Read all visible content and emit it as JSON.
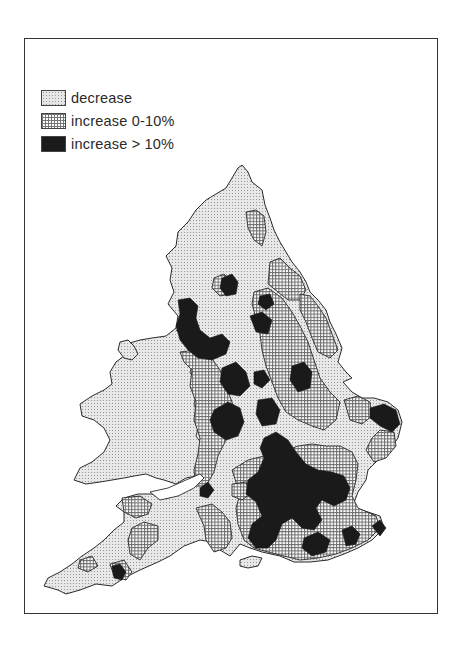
{
  "legend": {
    "items": [
      {
        "label": "decrease",
        "pattern": "stipple",
        "color": "#e6e6e6"
      },
      {
        "label": "increase 0-10%",
        "pattern": "dotted-grid",
        "color": "#ffffff"
      },
      {
        "label": "increase > 10%",
        "pattern": "solid",
        "color": "#1a1a1a"
      }
    ]
  },
  "map": {
    "region": "England and Wales",
    "categories": [
      "decrease",
      "increase 0-10%",
      "increase > 10%"
    ]
  },
  "colors": {
    "border": "#333333",
    "outline": "#2a2a2a",
    "solid": "#1a1a1a"
  }
}
